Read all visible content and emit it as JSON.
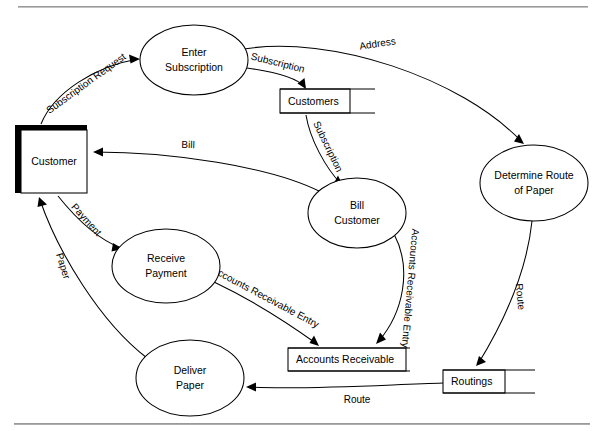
{
  "diagram": {
    "type": "data-flow-diagram",
    "title": "",
    "top_rule": true,
    "bottom_rule": true,
    "processes": [
      {
        "id": "enter_subscription",
        "label_line1": "Enter",
        "label_line2": "Subscription",
        "cx": 194,
        "cy": 60,
        "rx": 54,
        "ry": 35
      },
      {
        "id": "determine_route",
        "label_line1": "Determine Route",
        "label_line2": "of Paper",
        "cx": 534,
        "cy": 183,
        "rx": 54,
        "ry": 38
      },
      {
        "id": "bill_customer",
        "label_line1": "Bill",
        "label_line2": "Customer",
        "cx": 357,
        "cy": 213,
        "rx": 49,
        "ry": 35
      },
      {
        "id": "receive_payment",
        "label_line1": "Receive",
        "label_line2": "Payment",
        "cx": 166,
        "cy": 266,
        "rx": 54,
        "ry": 37
      },
      {
        "id": "deliver_paper",
        "label_line1": "Deliver",
        "label_line2": "Paper",
        "cx": 190,
        "cy": 378,
        "rx": 54,
        "ry": 38
      }
    ],
    "entities": [
      {
        "id": "customer",
        "label": "Customer",
        "x": 15,
        "y": 125,
        "w": 72,
        "h": 68
      }
    ],
    "datastores": [
      {
        "id": "customers",
        "label": "Customers",
        "x": 280,
        "y": 89,
        "w": 70,
        "h": 24,
        "line_w": 95
      },
      {
        "id": "accounts_receivable",
        "label": "Accounts Receivable",
        "x": 288,
        "y": 348,
        "w": 118,
        "h": 23,
        "line_w": 122
      },
      {
        "id": "routings",
        "label": "Routings",
        "x": 443,
        "y": 370,
        "w": 62,
        "h": 23,
        "line_w": 92
      }
    ],
    "flows": [
      {
        "id": "subscription_request",
        "label": "Subscription Request",
        "from": "customer",
        "to": "enter_subscription"
      },
      {
        "id": "subscription_to_store",
        "label": "Subscription",
        "from": "enter_subscription",
        "to": "customers"
      },
      {
        "id": "address",
        "label": "Address",
        "from": "enter_subscription",
        "to": "determine_route"
      },
      {
        "id": "subscription_to_bill",
        "label": "Subscription",
        "from": "customers",
        "to": "bill_customer"
      },
      {
        "id": "bill",
        "label": "Bill",
        "from": "bill_customer",
        "to": "customer"
      },
      {
        "id": "payment",
        "label": "Payment",
        "from": "customer",
        "to": "receive_payment"
      },
      {
        "id": "ar_entry_payment",
        "label": "Accounts Receivable Entry",
        "from": "receive_payment",
        "to": "accounts_receivable"
      },
      {
        "id": "ar_entry_bill",
        "label": "Accounts Receivable Entry",
        "from": "bill_customer",
        "to": "accounts_receivable"
      },
      {
        "id": "route_to_store",
        "label": "Route",
        "from": "determine_route",
        "to": "routings"
      },
      {
        "id": "route_to_deliver",
        "label": "Route",
        "from": "routings",
        "to": "deliver_paper"
      },
      {
        "id": "paper",
        "label": "Paper",
        "from": "deliver_paper",
        "to": "customer"
      }
    ]
  }
}
